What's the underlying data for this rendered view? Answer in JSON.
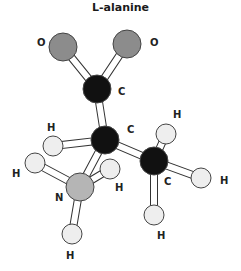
{
  "title": "L-alanine",
  "colors": {
    "carbon": "#111111",
    "oxygen": "#8c8c8c",
    "nitrogen": "#b5b5b5",
    "hydrogen": "#eeeeee",
    "bond_outline": "#333333"
  },
  "atoms": [
    {
      "id": "O1",
      "element": "O",
      "label": "O",
      "x": 63,
      "y": 47,
      "r": 14,
      "lx": 37,
      "ly": 46
    },
    {
      "id": "O2",
      "element": "O",
      "label": "O",
      "x": 127,
      "y": 44,
      "r": 14,
      "lx": 150,
      "ly": 46
    },
    {
      "id": "C1",
      "element": "C",
      "label": "C",
      "x": 97,
      "y": 89,
      "r": 14,
      "lx": 118,
      "ly": 95
    },
    {
      "id": "C2",
      "element": "C",
      "label": "C",
      "x": 105,
      "y": 140,
      "r": 14,
      "lx": 127,
      "ly": 133
    },
    {
      "id": "C3",
      "element": "C",
      "label": "C",
      "x": 154,
      "y": 161,
      "r": 14,
      "lx": 164,
      "ly": 185
    },
    {
      "id": "N",
      "element": "N",
      "label": "N",
      "x": 80,
      "y": 187,
      "r": 14,
      "lx": 55,
      "ly": 201
    },
    {
      "id": "H1",
      "element": "H",
      "label": "H",
      "x": 53,
      "y": 146,
      "r": 10,
      "lx": 47,
      "ly": 131
    },
    {
      "id": "H2",
      "element": "H",
      "label": "H",
      "x": 35,
      "y": 163,
      "r": 10,
      "lx": 12,
      "ly": 177
    },
    {
      "id": "H3",
      "element": "H",
      "label": "H",
      "x": 110,
      "y": 169,
      "r": 10,
      "lx": 115,
      "ly": 191
    },
    {
      "id": "H4",
      "element": "H",
      "label": "H",
      "x": 72,
      "y": 234,
      "r": 10,
      "lx": 66,
      "ly": 259
    },
    {
      "id": "H5",
      "element": "H",
      "label": "H",
      "x": 166,
      "y": 134,
      "r": 10,
      "lx": 173,
      "ly": 118
    },
    {
      "id": "H6",
      "element": "H",
      "label": "H",
      "x": 201,
      "y": 178,
      "r": 10,
      "lx": 220,
      "ly": 184
    },
    {
      "id": "H7",
      "element": "H",
      "label": "H",
      "x": 154,
      "y": 215,
      "r": 10,
      "lx": 157,
      "ly": 239
    }
  ],
  "bonds": [
    [
      "C1",
      "O1"
    ],
    [
      "C1",
      "O2"
    ],
    [
      "C1",
      "C2"
    ],
    [
      "C2",
      "H1"
    ],
    [
      "C2",
      "C3"
    ],
    [
      "C2",
      "N"
    ],
    [
      "N",
      "H2"
    ],
    [
      "N",
      "H3"
    ],
    [
      "N",
      "H4"
    ],
    [
      "C3",
      "H5"
    ],
    [
      "C3",
      "H6"
    ],
    [
      "C3",
      "H7"
    ]
  ]
}
